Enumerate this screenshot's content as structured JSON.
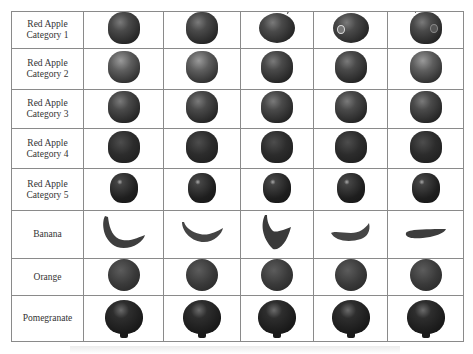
{
  "table": {
    "columns": 6,
    "images_per_row": 5,
    "rows": [
      {
        "label_line1": "Red Apple",
        "label_line2": "Category 1",
        "kind": "apple-1"
      },
      {
        "label_line1": "Red Apple",
        "label_line2": "Category 2",
        "kind": "apple-2"
      },
      {
        "label_line1": "Red Apple",
        "label_line2": "Category 3",
        "kind": "apple-3"
      },
      {
        "label_line1": "Red Apple",
        "label_line2": "Category 4",
        "kind": "apple-4"
      },
      {
        "label_line1": "Red Apple",
        "label_line2": "Category 5",
        "kind": "apple-5"
      },
      {
        "label_line1": "Banana",
        "label_line2": "",
        "kind": "banana"
      },
      {
        "label_line1": "Orange",
        "label_line2": "",
        "kind": "orange"
      },
      {
        "label_line1": "Pomegranate",
        "label_line2": "",
        "kind": "pomegranate"
      }
    ]
  },
  "colors": {
    "grid": "#8a8a8a",
    "text": "#333333",
    "background": "#ffffff"
  }
}
